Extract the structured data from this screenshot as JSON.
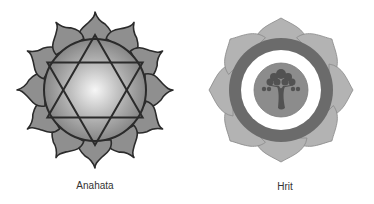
{
  "figures": [
    {
      "name": "Anahata",
      "label": "Anahata",
      "description": "Twelve-petaled lotus with hexagram (six-pointed star) over a radially shaded circle"
    },
    {
      "name": "Hrit",
      "label": "Hrit",
      "description": "Eight-petaled lotus with dark ring, white ring, and central disc containing a tree"
    }
  ],
  "colors": {
    "petal_anahata": "#8a8a8a",
    "outline": "#2b2b2b",
    "circle_light": "#f4f4f4",
    "circle_dark": "#7a7a7a",
    "petal_hrit": "#b5b5b5",
    "ring_dark": "#6b6b6b",
    "ring_white": "#ffffff",
    "disc": "#8c8c8c",
    "tree": "#555555"
  }
}
